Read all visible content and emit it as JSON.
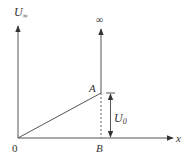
{
  "diagram": {
    "axes": {
      "vertical_label": "U",
      "vertical_label_sub": "∞",
      "horizontal_label": "x",
      "origin_label": "0"
    },
    "points": {
      "A": "A",
      "B": "B"
    },
    "infinity_label": "∞",
    "dimension": {
      "label": "U",
      "label_sub": "0"
    },
    "colors": {
      "line": "#555555",
      "text": "#333333"
    }
  }
}
